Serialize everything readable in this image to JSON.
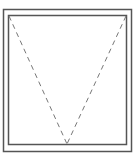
{
  "diagram": {
    "type": "window-elevation-symbol",
    "colors": {
      "frame": "#555555",
      "sash": "#555555",
      "opening_indicator": "#777777",
      "background": "#ffffff"
    },
    "outer_frame": {
      "x": 3,
      "y": 9,
      "width": 129,
      "height": 143
    },
    "inner_sash": {
      "x": 8,
      "y": 15,
      "width": 119,
      "height": 130
    },
    "opening_lines": {
      "apex": {
        "x": 67,
        "y": 145
      },
      "left_start": {
        "x": 8,
        "y": 15
      },
      "right_start": {
        "x": 127,
        "y": 15
      },
      "dash": "5,4"
    }
  }
}
